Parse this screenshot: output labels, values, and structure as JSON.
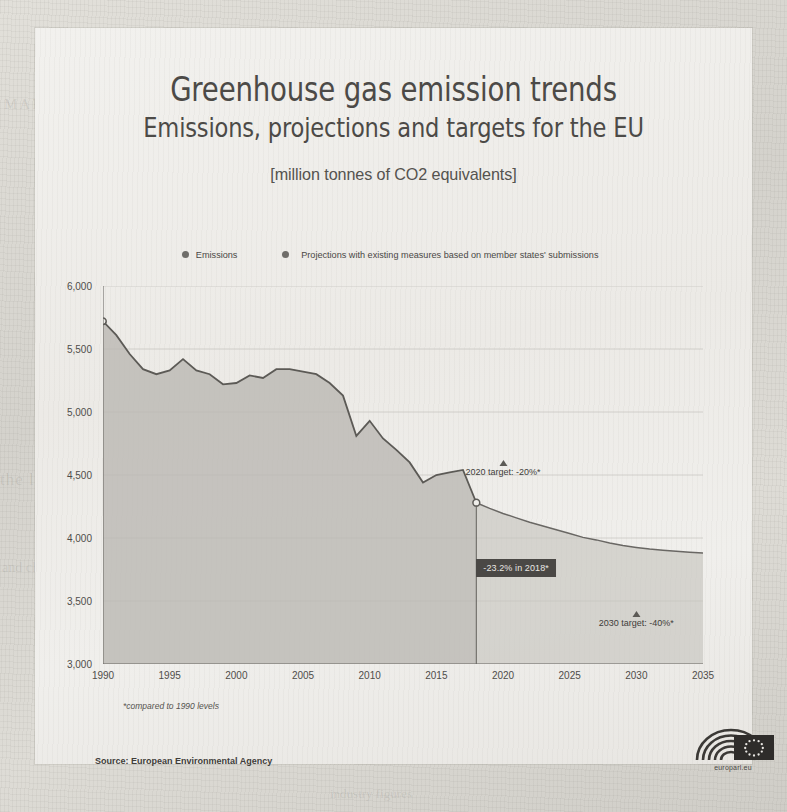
{
  "infographic": {
    "main_title": "Greenhouse gas emission trends",
    "sub_title": "Emissions, projections and targets for the EU",
    "unit_title": "[million tonnes of CO2 equivalents]",
    "footnote": "*compared to 1990 levels",
    "source": "Source: European Environmental Agency",
    "logo_caption": "europarl.eu",
    "logo_name": "european-parliament-logo"
  },
  "colors": {
    "line": "#5c5a56",
    "area_fill": "#bab8b3",
    "projection_fill": "#c6c4bf",
    "text": "#4c4a47",
    "callout_bg": "#4a4845",
    "callout_text": "#e9e7e3",
    "grid": "#bfbdb8",
    "paper": "#efeeea"
  },
  "chart_data": {
    "type": "area",
    "title": "Greenhouse gas emission trends",
    "subtitle": "Emissions, projections and targets for the EU",
    "xlabel": "",
    "ylabel": "million tonnes of CO2 equivalents",
    "xlim": [
      1990,
      2035
    ],
    "ylim": [
      3000,
      6000
    ],
    "ytick_labels": [
      "6,000",
      "5,500",
      "5,000",
      "4,500",
      "4,000",
      "3,500",
      "3,000"
    ],
    "ytick_values": [
      6000,
      5500,
      5000,
      4500,
      4000,
      3500,
      3000
    ],
    "xtick_labels": [
      "1990",
      "1995",
      "2000",
      "2005",
      "2010",
      "2015",
      "2020",
      "2025",
      "2030",
      "2035"
    ],
    "xtick_values": [
      1990,
      1995,
      2000,
      2005,
      2010,
      2015,
      2020,
      2025,
      2030,
      2035
    ],
    "minor_tick_interval": 1,
    "grid": true,
    "legend_position": "top-center",
    "legend": [
      {
        "label": "Emissions",
        "marker": "circle",
        "color": "#6f6d69"
      },
      {
        "label": "Projections with existing measures based on member states' submissions",
        "marker": "circle",
        "color": "#6f6d69"
      }
    ],
    "series": [
      {
        "name": "Emissions",
        "kind": "historical",
        "x": [
          1990,
          1991,
          1992,
          1993,
          1994,
          1995,
          1996,
          1997,
          1998,
          1999,
          2000,
          2001,
          2002,
          2003,
          2004,
          2005,
          2006,
          2007,
          2008,
          2009,
          2010,
          2011,
          2012,
          2013,
          2014,
          2015,
          2016,
          2017,
          2018
        ],
        "values": [
          5720,
          5610,
          5460,
          5340,
          5300,
          5330,
          5420,
          5330,
          5300,
          5220,
          5230,
          5290,
          5270,
          5340,
          5340,
          5320,
          5300,
          5230,
          5130,
          4810,
          4930,
          4790,
          4700,
          4600,
          4440,
          4500,
          4520,
          4540,
          4280
        ]
      },
      {
        "name": "Projections with existing measures based on member states' submissions",
        "kind": "projection",
        "x": [
          2018,
          2019,
          2020,
          2021,
          2022,
          2023,
          2024,
          2025,
          2026,
          2027,
          2028,
          2029,
          2030,
          2031,
          2032,
          2033,
          2034,
          2035
        ],
        "values": [
          4280,
          4235,
          4195,
          4160,
          4125,
          4095,
          4065,
          4035,
          4005,
          3985,
          3960,
          3940,
          3925,
          3912,
          3902,
          3894,
          3886,
          3880
        ]
      }
    ],
    "markers": [
      {
        "name": "transition-point",
        "x": 2018,
        "y": 4280,
        "style": "hollow-circle"
      }
    ],
    "annotations": [
      {
        "name": "target-2020",
        "label": "2020 target: -20%*",
        "x": 2020,
        "y": 4620,
        "marker": "triangle-up"
      },
      {
        "name": "target-2030",
        "label": "2030 target: -40%*",
        "x": 2030,
        "y": 3420,
        "marker": "triangle-up"
      },
      {
        "name": "callout-2018",
        "label": "-23.2% in 2018*",
        "x": 2018,
        "y": 3760
      }
    ]
  },
  "ghost_text": {
    "g1": "MARKET REPORT",
    "g2": "the long term outlook",
    "g3": "and climate policy",
    "g4": "industry figures"
  }
}
